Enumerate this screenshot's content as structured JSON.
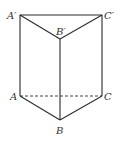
{
  "figure": {
    "type": "triangular-prism",
    "stroke_color": "#2a2a2a",
    "vertices": {
      "A1": {
        "label": "A′",
        "x": 20,
        "y": 15
      },
      "B1": {
        "label": "B′",
        "x": 60,
        "y": 39
      },
      "C1": {
        "label": "C′",
        "x": 102,
        "y": 15
      },
      "A": {
        "label": "A",
        "x": 20,
        "y": 96
      },
      "B": {
        "label": "B",
        "x": 60,
        "y": 120
      },
      "C": {
        "label": "C",
        "x": 102,
        "y": 96
      }
    },
    "edges_solid": [
      "A1-C1",
      "A1-B1",
      "B1-C1",
      "A1-A",
      "B1-B",
      "C1-C",
      "A-B",
      "B-C"
    ],
    "edges_dashed": [
      "A-C"
    ]
  }
}
